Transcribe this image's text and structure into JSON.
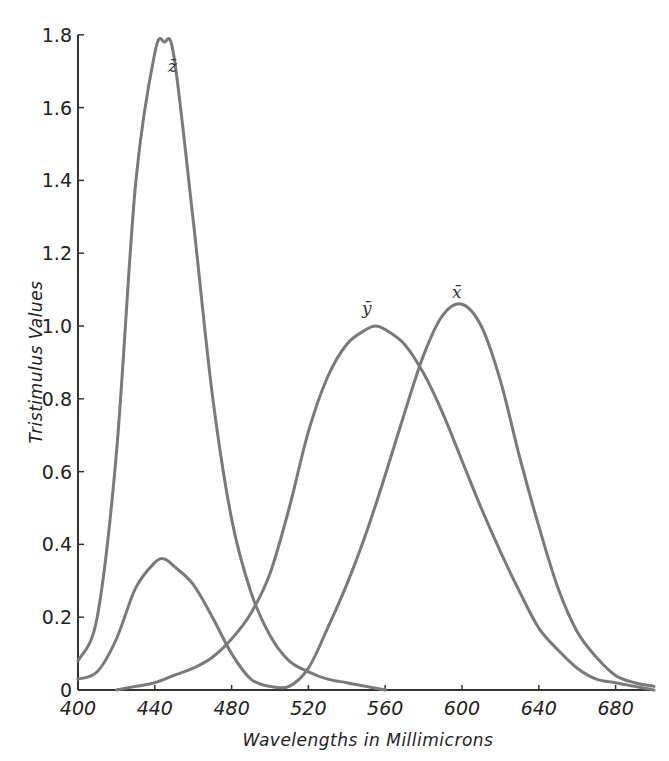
{
  "chart_data": {
    "type": "line",
    "title": "",
    "xlabel": "Wavelengths in Millimicrons",
    "ylabel": "Tristimulus Values",
    "xlim": [
      400,
      700
    ],
    "ylim": [
      0,
      1.8
    ],
    "grid": false,
    "legend": "inline curve labels",
    "x_ticks": [
      400,
      440,
      480,
      520,
      560,
      600,
      640,
      680
    ],
    "x_tick_labels": [
      "400",
      "440",
      "480",
      "520",
      "560",
      "600",
      "640",
      "680"
    ],
    "y_ticks": [
      0,
      0.2,
      0.4,
      0.6,
      0.8,
      1.0,
      1.2,
      1.4,
      1.6,
      1.8
    ],
    "y_tick_labels": [
      "0",
      "0.2",
      "0.4",
      "0.6",
      "0.8",
      "1.0",
      "1.2",
      "1.4",
      "1.6",
      "1.8"
    ],
    "series": [
      {
        "name": "z-bar",
        "label": "z̄",
        "x": [
          400,
          410,
          420,
          430,
          440,
          445,
          450,
          460,
          470,
          480,
          490,
          500,
          510,
          520,
          530,
          540,
          550,
          560
        ],
        "values": [
          0.08,
          0.2,
          0.65,
          1.39,
          1.75,
          1.78,
          1.74,
          1.29,
          0.81,
          0.47,
          0.27,
          0.15,
          0.08,
          0.05,
          0.03,
          0.02,
          0.01,
          0.0
        ]
      },
      {
        "name": "y-bar",
        "label": "ȳ",
        "x": [
          420,
          430,
          440,
          450,
          460,
          470,
          480,
          490,
          500,
          510,
          520,
          530,
          540,
          550,
          555,
          560,
          570,
          580,
          590,
          600,
          610,
          620,
          630,
          640,
          650,
          660,
          670,
          680,
          690,
          700
        ],
        "values": [
          0.0,
          0.01,
          0.02,
          0.04,
          0.06,
          0.09,
          0.14,
          0.21,
          0.32,
          0.5,
          0.71,
          0.86,
          0.95,
          0.99,
          1.0,
          0.99,
          0.95,
          0.87,
          0.76,
          0.63,
          0.5,
          0.38,
          0.27,
          0.17,
          0.11,
          0.06,
          0.03,
          0.02,
          0.01,
          0.0
        ]
      },
      {
        "name": "x-bar",
        "label": "x̄",
        "x": [
          400,
          410,
          420,
          430,
          440,
          445,
          450,
          460,
          470,
          480,
          490,
          500,
          510,
          520,
          530,
          540,
          550,
          560,
          570,
          580,
          590,
          600,
          610,
          620,
          630,
          640,
          650,
          660,
          670,
          680,
          690,
          700
        ],
        "values": [
          0.03,
          0.05,
          0.14,
          0.28,
          0.35,
          0.36,
          0.34,
          0.29,
          0.2,
          0.1,
          0.03,
          0.01,
          0.01,
          0.06,
          0.17,
          0.29,
          0.43,
          0.59,
          0.76,
          0.92,
          1.03,
          1.06,
          1.0,
          0.85,
          0.64,
          0.45,
          0.28,
          0.16,
          0.09,
          0.04,
          0.02,
          0.01
        ]
      }
    ]
  },
  "labels": {
    "xlabel": "Wavelengths in Millimicrons",
    "ylabel": "Tristimulus Values",
    "z_curve": "z̄",
    "y_curve": "ȳ",
    "x_curve": "x̄"
  }
}
